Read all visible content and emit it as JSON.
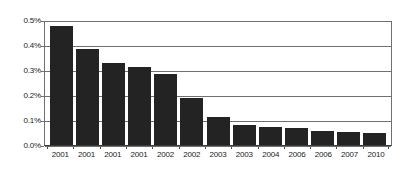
{
  "chart_data": {
    "type": "bar",
    "title": "",
    "subtitle": "",
    "xlabel": "",
    "ylabel": "",
    "categories": [
      "2001",
      "2001",
      "2001",
      "2001",
      "2002",
      "2002",
      "2003",
      "2003",
      "2004",
      "2006",
      "2006",
      "2007",
      "2010"
    ],
    "values": [
      0.476,
      0.385,
      0.327,
      0.311,
      0.286,
      0.188,
      0.113,
      0.082,
      0.072,
      0.067,
      0.058,
      0.051,
      0.048
    ],
    "value_unit": "%",
    "ylim": [
      0.0,
      0.5
    ],
    "ytick_values": [
      0.0,
      0.1,
      0.2,
      0.3,
      0.4,
      0.5
    ],
    "ytick_labels": [
      "0.0%",
      "0.1%",
      "0.2%",
      "0.3%",
      "0.4%",
      "0.5%"
    ],
    "grid": true,
    "grid_axis": "y",
    "legend": false,
    "legend_position": "none",
    "series": [
      {
        "name": "",
        "color": "#232323",
        "values": [
          0.476,
          0.385,
          0.327,
          0.311,
          0.286,
          0.188,
          0.113,
          0.082,
          0.072,
          0.067,
          0.058,
          0.051,
          0.048
        ]
      }
    ],
    "colors": {
      "bar": "#232323",
      "grid": "#6f6f6f",
      "axis": "#3a3a3a",
      "text": "#1b1b1b",
      "background": "#ffffff"
    }
  }
}
